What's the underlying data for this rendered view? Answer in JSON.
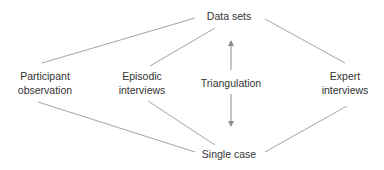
{
  "diagram": {
    "top_node": {
      "label": "Data sets"
    },
    "bottom_node": {
      "label": "Single case"
    },
    "center_label": "Triangulation",
    "methods": [
      {
        "line1": "Participant",
        "line2": "observation"
      },
      {
        "line1": "Episodic",
        "line2": "interviews"
      },
      {
        "line1": "Expert",
        "line2": "interviews"
      }
    ],
    "colors": {
      "line": "#9a9a9a",
      "arrow": "#8c8c8c",
      "text": "#333333"
    }
  }
}
